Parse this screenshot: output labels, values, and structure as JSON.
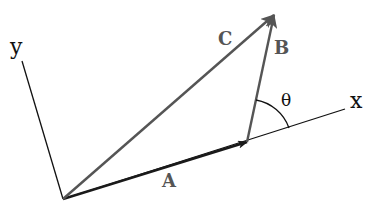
{
  "diagram": {
    "type": "vector-addition",
    "axes": {
      "x_label": "x",
      "y_label": "y"
    },
    "vectors": [
      {
        "name": "A",
        "label": "A",
        "from": "origin",
        "to": "tip-of-A",
        "color": "#1a1a1a"
      },
      {
        "name": "B",
        "label": "B",
        "from": "tip-of-A",
        "to": "tip-of-C",
        "color": "#555555"
      },
      {
        "name": "C",
        "label": "C",
        "from": "origin",
        "to": "tip-of-C",
        "color": "#555555"
      }
    ],
    "angle": {
      "label": "θ",
      "between": [
        "x-axis",
        "B"
      ]
    },
    "colors": {
      "axis": "#111111",
      "vector_dark": "#1a1a1a",
      "vector_gray": "#555555",
      "label_gray": "#555555",
      "background": "#ffffff"
    }
  }
}
